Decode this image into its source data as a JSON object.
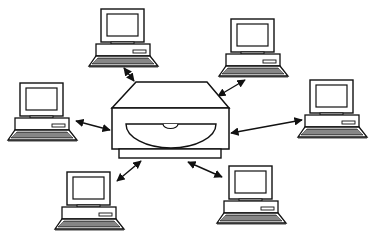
{
  "diagram": {
    "type": "network-star-topology",
    "hub": {
      "name": "central-drive-server",
      "icon": "optical-drive-icon"
    },
    "nodes": [
      {
        "id": "pc-top-left",
        "icon": "desktop-computer-icon",
        "x": 89,
        "y": 9
      },
      {
        "id": "pc-top-right",
        "icon": "desktop-computer-icon",
        "x": 219,
        "y": 19
      },
      {
        "id": "pc-left",
        "icon": "desktop-computer-icon",
        "x": 8,
        "y": 83
      },
      {
        "id": "pc-right",
        "icon": "desktop-computer-icon",
        "x": 298,
        "y": 80
      },
      {
        "id": "pc-bottom-left",
        "icon": "desktop-computer-icon",
        "x": 55,
        "y": 172
      },
      {
        "id": "pc-bottom-right",
        "icon": "desktop-computer-icon",
        "x": 217,
        "y": 166
      }
    ],
    "connections": [
      {
        "from": "pc-top-left",
        "to": "hub",
        "style": "double-arrow"
      },
      {
        "from": "pc-top-right",
        "to": "hub",
        "style": "double-arrow"
      },
      {
        "from": "pc-left",
        "to": "hub",
        "style": "double-arrow"
      },
      {
        "from": "pc-right",
        "to": "hub",
        "style": "double-arrow"
      },
      {
        "from": "pc-bottom-left",
        "to": "hub",
        "style": "double-arrow"
      },
      {
        "from": "pc-bottom-right",
        "to": "hub",
        "style": "double-arrow"
      }
    ],
    "colors": {
      "stroke": "#111111",
      "background": "#ffffff",
      "keyboard": "#555555"
    }
  }
}
